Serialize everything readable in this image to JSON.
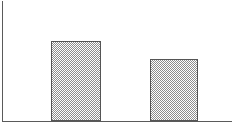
{
  "chart_data": {
    "type": "bar",
    "title": "",
    "subtitle": "",
    "xlabel": "",
    "ylabel": "",
    "categories": [
      "",
      ""
    ],
    "values": [
      0.67,
      0.52
    ],
    "bar_pixel_heights": [
      80,
      62
    ],
    "ylim": [
      0,
      1
    ],
    "xlim": [
      0,
      1
    ],
    "grid": false,
    "legend": false,
    "legend_position": "none",
    "tick_labels_x": [],
    "tick_labels_y": [],
    "annotations": [],
    "series": [
      {
        "name": "",
        "values": [
          0.67,
          0.52
        ]
      }
    ]
  },
  "figure": {
    "width": 236,
    "height": 133,
    "background_color": "#ffffff"
  },
  "axes": {
    "origin_x": 2,
    "baseline_y": 121,
    "axis_top_y": 1,
    "axis_right_x": 232,
    "axis_color": "#5a5a5a",
    "axis_line_width": 1
  },
  "bars": [
    {
      "name": "bar-1",
      "x": 51,
      "y": 41,
      "width": 50,
      "height": 80,
      "fill_pattern": "checkerboard-50",
      "fill_color": "#8d8d8d",
      "border_color": "#555555"
    },
    {
      "name": "bar-2",
      "x": 150,
      "y": 59,
      "width": 48,
      "height": 62,
      "fill_pattern": "checkerboard-50",
      "fill_color": "#8d8d8d",
      "border_color": "#555555"
    }
  ]
}
